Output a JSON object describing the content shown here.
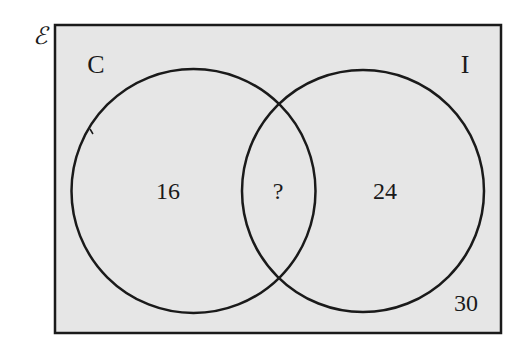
{
  "diagram": {
    "type": "venn",
    "universal_set": {
      "symbol": "ℰ",
      "outside_value": "30"
    },
    "sets": [
      {
        "name": "C",
        "label": "C",
        "only_value": "16"
      },
      {
        "name": "I",
        "label": "I",
        "only_value": "24"
      }
    ],
    "intersection": {
      "sets": [
        "C",
        "I"
      ],
      "value": "?"
    },
    "colors": {
      "background_fill": "#e6e6e6",
      "stroke": "#1a1a1a"
    }
  }
}
